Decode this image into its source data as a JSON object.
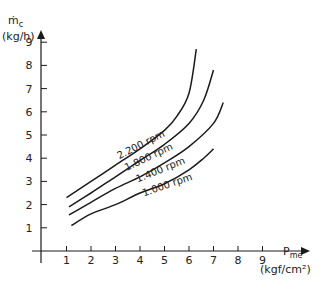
{
  "chart_data": {
    "type": "line",
    "title": "",
    "xlabel": "Pme (kgf/cm²)",
    "ylabel": "ṁc (kg/h)",
    "x_label_main": "P",
    "x_label_sub": "me",
    "x_unit": "(kgf/cm²)",
    "y_label_main": "ṁ",
    "y_label_sub": "c",
    "y_unit": "(kg/h)",
    "xlim": [
      0,
      10
    ],
    "ylim": [
      0,
      10
    ],
    "x_ticks": [
      1,
      2,
      3,
      4,
      5,
      6,
      7,
      8,
      9
    ],
    "y_ticks": [
      1,
      2,
      3,
      4,
      5,
      6,
      7,
      8,
      9
    ],
    "grid": false,
    "legend": "inline labels on curves",
    "series": [
      {
        "name": "2.200 rpm",
        "label": "2.200 rpm",
        "points": [
          [
            1.0,
            2.3
          ],
          [
            2.0,
            3.0
          ],
          [
            3.0,
            3.7
          ],
          [
            4.0,
            4.4
          ],
          [
            5.0,
            5.2
          ],
          [
            5.5,
            5.8
          ],
          [
            6.0,
            6.8
          ],
          [
            6.3,
            8.7
          ]
        ]
      },
      {
        "name": "1.800 rpm",
        "label": "1.800 rpm",
        "points": [
          [
            1.1,
            1.9
          ],
          [
            2.0,
            2.5
          ],
          [
            3.0,
            3.2
          ],
          [
            4.0,
            3.9
          ],
          [
            5.0,
            4.6
          ],
          [
            6.0,
            5.5
          ],
          [
            6.6,
            6.5
          ],
          [
            7.0,
            7.8
          ]
        ]
      },
      {
        "name": "1.400 rpm",
        "label": "1.400 rpm",
        "points": [
          [
            1.1,
            1.55
          ],
          [
            2.0,
            2.1
          ],
          [
            3.0,
            2.7
          ],
          [
            4.0,
            3.2
          ],
          [
            5.0,
            3.8
          ],
          [
            6.0,
            4.5
          ],
          [
            7.0,
            5.5
          ],
          [
            7.4,
            6.4
          ]
        ]
      },
      {
        "name": "1.000 rpm",
        "label": "1.000 rpm",
        "points": [
          [
            1.2,
            1.1
          ],
          [
            2.0,
            1.6
          ],
          [
            3.0,
            2.0
          ],
          [
            4.0,
            2.5
          ],
          [
            5.0,
            2.9
          ],
          [
            6.0,
            3.5
          ],
          [
            6.6,
            4.0
          ],
          [
            7.0,
            4.4
          ]
        ]
      }
    ]
  }
}
